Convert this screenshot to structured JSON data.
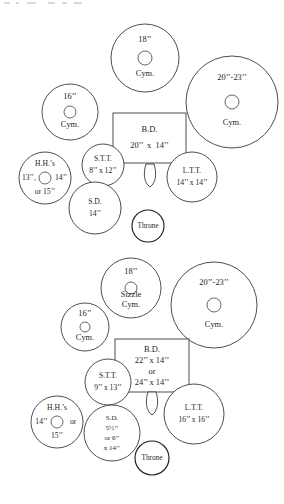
{
  "diagram": {
    "type": "drum-kit-layout",
    "stroke_color": "#3a3a3a",
    "background_color": "#ffffff"
  },
  "kits": [
    {
      "id": "kit-top",
      "name": "Standard Kit",
      "pieces": [
        {
          "id": "cym-18",
          "name": "18-inch-cymbal",
          "kind": "cymbal",
          "lines": [
            "18’’",
            "Cym."
          ],
          "cx": 145,
          "cy": 58,
          "r": 34,
          "bell_r": 7
        },
        {
          "id": "cym-16",
          "name": "16-inch-cymbal",
          "kind": "cymbal",
          "lines": [
            "16’’",
            "Cym."
          ],
          "cx": 70,
          "cy": 112,
          "r": 28,
          "bell_r": 6
        },
        {
          "id": "cym-20-23",
          "name": "20-23-inch-cymbal",
          "kind": "cymbal",
          "lines": [
            "20’’-23’’",
            "Cym."
          ],
          "cx": 232,
          "cy": 102,
          "r": 46,
          "bell_r": 7
        },
        {
          "id": "bd",
          "name": "bass-drum",
          "kind": "bass-drum",
          "lines": [
            "B.D.",
            "20’’  x  14’’"
          ],
          "x": 113,
          "y": 113,
          "w": 73,
          "h": 50
        },
        {
          "id": "stt",
          "name": "small-tom-tom",
          "kind": "tom",
          "lines": [
            "S.T.T.",
            "8’’ x 12’’"
          ],
          "cx": 103,
          "cy": 165,
          "r": 21
        },
        {
          "id": "ltt",
          "name": "large-tom-tom",
          "kind": "tom",
          "lines": [
            "L.T.T.",
            "14’’ x 14’’"
          ],
          "cx": 192,
          "cy": 177,
          "r": 25
        },
        {
          "id": "hh",
          "name": "hi-hats",
          "kind": "hi-hat",
          "lines": [
            "H.H.’s",
            "13’’,",
            "14’’",
            "or 15’’"
          ],
          "cx": 45,
          "cy": 178,
          "r": 26,
          "bell_r": 6
        },
        {
          "id": "sd",
          "name": "snare-drum",
          "kind": "snare",
          "lines": [
            "S.D.",
            "14’’"
          ],
          "cx": 95,
          "cy": 208,
          "r": 26
        },
        {
          "id": "pedal",
          "name": "bass-drum-pedal",
          "kind": "pedal",
          "cx": 150,
          "cy": 175
        },
        {
          "id": "throne",
          "name": "throne",
          "kind": "throne",
          "lines": [
            "Throne"
          ],
          "cx": 148,
          "cy": 226,
          "r": 16
        }
      ]
    },
    {
      "id": "kit-bottom",
      "name": "Larger Kit",
      "pieces": [
        {
          "id": "cym-18-sizzle",
          "name": "18-inch-sizzle-cymbal",
          "kind": "cymbal",
          "lines": [
            "18’’",
            "Sizzle",
            "Cym."
          ],
          "cx": 131,
          "cy": 288,
          "r": 30,
          "bell_r": 6
        },
        {
          "id": "cym-16b",
          "name": "16-inch-cymbal",
          "kind": "cymbal",
          "lines": [
            "16’’",
            "Cym."
          ],
          "cx": 85,
          "cy": 327,
          "r": 24,
          "bell_r": 5
        },
        {
          "id": "cym-20-23b",
          "name": "20-23-inch-cymbal",
          "kind": "cymbal",
          "lines": [
            "20’’-23’’",
            "Cym."
          ],
          "cx": 214,
          "cy": 305,
          "r": 43,
          "bell_r": 7
        },
        {
          "id": "bd-b",
          "name": "bass-drum",
          "kind": "bass-drum",
          "lines": [
            "B.D.",
            "22’’ x 14’’",
            "or",
            "24’’ x 14’’"
          ],
          "x": 115,
          "y": 339,
          "w": 74,
          "h": 53
        },
        {
          "id": "stt-b",
          "name": "small-tom-tom",
          "kind": "tom",
          "lines": [
            "S.T.T.",
            "9’’ x 13’’"
          ],
          "cx": 108,
          "cy": 382,
          "r": 23
        },
        {
          "id": "ltt-b",
          "name": "large-tom-tom",
          "kind": "tom",
          "lines": [
            "L.T.T.",
            "16’’ x 16’’"
          ],
          "cx": 194,
          "cy": 414,
          "r": 30
        },
        {
          "id": "hh-b",
          "name": "hi-hats",
          "kind": "hi-hat",
          "lines": [
            "H.H.’s",
            "14’’",
            "or",
            "15’’"
          ],
          "cx": 57,
          "cy": 422,
          "r": 26,
          "bell_r": 6
        },
        {
          "id": "sd-b",
          "name": "snare-drum",
          "kind": "snare",
          "lines": [
            "S.D.",
            "5½’’",
            "or 6’’",
            "x 14’’"
          ],
          "cx": 112,
          "cy": 433,
          "r": 28
        },
        {
          "id": "pedal-b",
          "name": "bass-drum-pedal",
          "kind": "pedal",
          "cx": 152,
          "cy": 403
        },
        {
          "id": "throne-b",
          "name": "throne",
          "kind": "throne",
          "lines": [
            "Throne"
          ],
          "cx": 152,
          "cy": 458,
          "r": 17
        }
      ]
    }
  ]
}
